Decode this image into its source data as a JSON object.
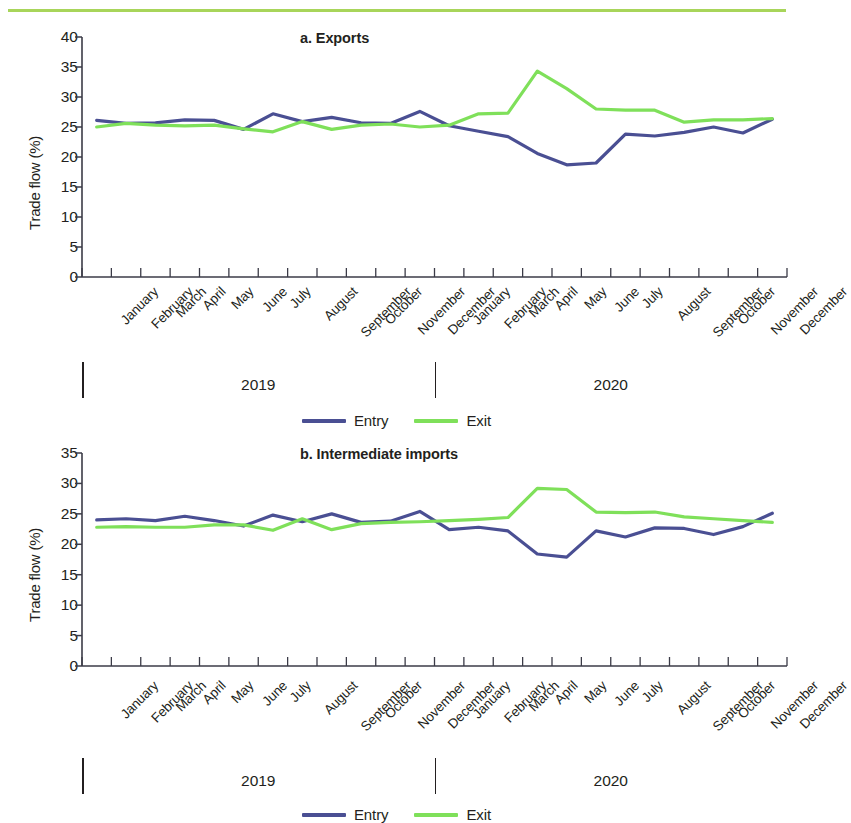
{
  "decoration": {
    "top_rule_color": "#a8d55a"
  },
  "series_colors": {
    "entry": "#4a4f93",
    "exit": "#7fe05a"
  },
  "legend": {
    "entries": [
      {
        "label": "Entry",
        "color": "#4a4f93"
      },
      {
        "label": "Exit",
        "color": "#7fe05a"
      }
    ]
  },
  "year_axis": {
    "labels": [
      "2019",
      "2020"
    ]
  },
  "chart_data": [
    {
      "type": "line",
      "panel": "a",
      "title": "a. Exports",
      "xlabel": "",
      "ylabel": "Trade flow (%)",
      "ylim": [
        0,
        40
      ],
      "yticks": [
        0,
        5,
        10,
        15,
        20,
        25,
        30,
        35,
        40
      ],
      "grid": false,
      "legend_position": "bottom-center",
      "years": [
        "2019",
        "2020"
      ],
      "categories": [
        "January",
        "February",
        "March",
        "April",
        "May",
        "June",
        "July",
        "August",
        "September",
        "October",
        "November",
        "December",
        "January",
        "February",
        "March",
        "April",
        "May",
        "June",
        "July",
        "August",
        "September",
        "October",
        "November",
        "December"
      ],
      "series": [
        {
          "name": "Entry",
          "color": "#4a4f93",
          "values": [
            26.1,
            25.6,
            25.7,
            26.2,
            26.1,
            24.6,
            27.2,
            25.9,
            26.6,
            25.7,
            25.6,
            27.6,
            25.2,
            24.3,
            23.4,
            20.6,
            18.7,
            19.0,
            23.8,
            23.5,
            24.1,
            25.0,
            24.0,
            26.3
          ]
        },
        {
          "name": "Exit",
          "color": "#7fe05a",
          "values": [
            25.0,
            25.6,
            25.3,
            25.2,
            25.3,
            24.7,
            24.2,
            25.9,
            24.6,
            25.3,
            25.5,
            25.0,
            25.3,
            27.2,
            27.3,
            34.3,
            31.4,
            28.0,
            27.8,
            27.8,
            25.8,
            26.2,
            26.2,
            26.4
          ]
        }
      ]
    },
    {
      "type": "line",
      "panel": "b",
      "title": "b. Intermediate imports",
      "xlabel": "",
      "ylabel": "Trade flow (%)",
      "ylim": [
        0,
        35
      ],
      "yticks": [
        0,
        5,
        10,
        15,
        20,
        25,
        30,
        35
      ],
      "grid": false,
      "legend_position": "bottom-center",
      "years": [
        "2019",
        "2020"
      ],
      "categories": [
        "January",
        "February",
        "March",
        "April",
        "May",
        "June",
        "July",
        "August",
        "September",
        "October",
        "November",
        "December",
        "January",
        "February",
        "March",
        "April",
        "May",
        "June",
        "July",
        "August",
        "September",
        "October",
        "November",
        "December"
      ],
      "series": [
        {
          "name": "Entry",
          "color": "#4a4f93",
          "values": [
            24.0,
            24.2,
            23.9,
            24.6,
            23.9,
            23.0,
            24.8,
            23.7,
            25.0,
            23.6,
            23.8,
            25.4,
            22.4,
            22.8,
            22.2,
            18.4,
            17.9,
            22.2,
            21.2,
            22.7,
            22.6,
            21.6,
            22.9,
            25.1
          ]
        },
        {
          "name": "Exit",
          "color": "#7fe05a",
          "values": [
            22.8,
            22.9,
            22.8,
            22.8,
            23.2,
            23.2,
            22.3,
            24.2,
            22.4,
            23.4,
            23.6,
            23.7,
            23.9,
            24.1,
            24.4,
            29.2,
            29.0,
            25.3,
            25.2,
            25.3,
            24.5,
            24.2,
            23.9,
            23.6
          ]
        }
      ]
    }
  ]
}
